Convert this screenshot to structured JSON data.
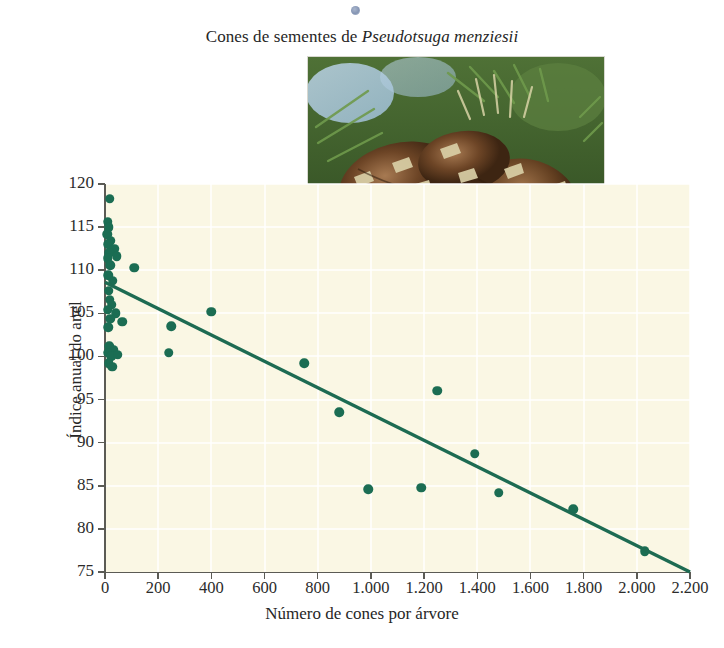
{
  "figure": {
    "title_prefix": "Cones de sementes de ",
    "title_species": "Pseudotsuga menziesii",
    "photo_alt": "Cones de sementes de Pseudotsuga menziesii em um ramo",
    "photo_name": "douglas-fir-seed-cones-photo"
  },
  "chart_data": {
    "type": "scatter",
    "title": "Cones de sementes de Pseudotsuga menziesii",
    "xlabel": "Número de cones por árvore",
    "ylabel": "Índice anual do anel",
    "xlim": [
      0,
      2200
    ],
    "ylim": [
      75,
      120
    ],
    "xticks": [
      0,
      200,
      400,
      600,
      800,
      1000,
      1200,
      1400,
      1600,
      1800,
      2000,
      2200
    ],
    "xticklabels": [
      "0",
      "200",
      "400",
      "600",
      "800",
      "1.000",
      "1.200",
      "1.400",
      "1.600",
      "1.800",
      "2.000",
      "2.200"
    ],
    "yticks": [
      75,
      80,
      85,
      90,
      95,
      100,
      105,
      110,
      115,
      120
    ],
    "yticklabels": [
      "75",
      "80",
      "85",
      "90",
      "95",
      "100",
      "105",
      "110",
      "115",
      "120"
    ],
    "grid": true,
    "legend": null,
    "marker_color": "#1b6d53",
    "line_color": "#1d6b52",
    "plot_background": "#faf7e4",
    "points": [
      [
        18,
        118.3
      ],
      [
        10,
        115.6
      ],
      [
        14,
        115.0
      ],
      [
        8,
        114.2
      ],
      [
        22,
        113.4
      ],
      [
        12,
        113.0
      ],
      [
        35,
        112.5
      ],
      [
        16,
        112.0
      ],
      [
        10,
        111.4
      ],
      [
        45,
        111.6
      ],
      [
        20,
        110.6
      ],
      [
        110,
        110.3
      ],
      [
        12,
        109.4
      ],
      [
        30,
        108.8
      ],
      [
        14,
        107.6
      ],
      [
        18,
        106.6
      ],
      [
        25,
        106.0
      ],
      [
        10,
        105.4
      ],
      [
        40,
        105.0
      ],
      [
        20,
        104.4
      ],
      [
        65,
        104.0
      ],
      [
        12,
        103.4
      ],
      [
        400,
        105.2
      ],
      [
        250,
        103.5
      ],
      [
        16,
        101.2
      ],
      [
        32,
        100.8
      ],
      [
        10,
        100.4
      ],
      [
        24,
        100.0
      ],
      [
        48,
        100.2
      ],
      [
        240,
        100.4
      ],
      [
        14,
        99.2
      ],
      [
        28,
        98.8
      ],
      [
        750,
        99.2
      ],
      [
        880,
        93.5
      ],
      [
        1250,
        96.0
      ],
      [
        1390,
        88.7
      ],
      [
        1480,
        84.2
      ],
      [
        990,
        84.6
      ],
      [
        1190,
        84.8
      ],
      [
        1760,
        82.3
      ],
      [
        2030,
        77.4
      ]
    ],
    "fit_line": {
      "label": "linha de regressão",
      "x0": 0,
      "y0": 108.6,
      "x1": 2200,
      "y1": 75.0
    }
  }
}
